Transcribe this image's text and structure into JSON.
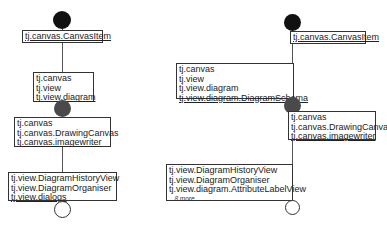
{
  "left": {
    "box1": {
      "items": [
        "tj.canvas.CanvasItem"
      ]
    },
    "box2": {
      "items": [
        "tj.canvas",
        "tj.view",
        "tj.view.diagram"
      ]
    },
    "box3": {
      "items": [
        "tj.canvas",
        "tj.canvas.DrawingCanvas",
        "tj.canvas.imagewriter"
      ]
    },
    "box4": {
      "items": [
        "tj.view.DiagramHistoryView",
        "tj.view.DiagramOrganiser",
        "tj.view.dialogs"
      ]
    }
  },
  "right": {
    "box1": {
      "items": [
        "tj.canvas.CanvasItem"
      ]
    },
    "box2": {
      "items": [
        "tj.canvas",
        "tj.view",
        "tj.view.diagram",
        "tj.view.diagram.DiagramSchema"
      ]
    },
    "box3": {
      "items": [
        "tj.canvas",
        "tj.canvas.DrawingCanvas",
        "tj.canvas.imagewriter"
      ]
    },
    "box4": {
      "items": [
        "tj.view.DiagramHistoryView",
        "tj.view.DiagramOrganiser",
        "tj.view.diagram.AttributeLabelView"
      ],
      "more": "...8 more..."
    }
  },
  "colors": {
    "start_node": "#111111",
    "mid_node": "#4a4a4a",
    "line": "#555555"
  }
}
